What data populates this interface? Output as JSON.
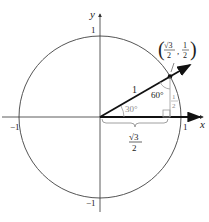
{
  "diagram": {
    "axes": {
      "x_label": "x",
      "y_label": "y",
      "x_pos_tick": "1",
      "x_neg_tick": "−1",
      "y_pos_tick": "1",
      "y_neg_tick": "−1"
    },
    "point": {
      "x_num": "√3",
      "x_den": "2",
      "y_num": "1",
      "y_den": "2"
    },
    "hypotenuse_label": "1",
    "angle_at_origin": "30°",
    "angle_at_point": "60°",
    "adjacent_num": "√3",
    "adjacent_den": "2",
    "opposite_num": "1",
    "opposite_den": "2",
    "colors": {
      "line": "#111111",
      "circle": "#555555",
      "annotation": "#8a8a8a"
    }
  }
}
